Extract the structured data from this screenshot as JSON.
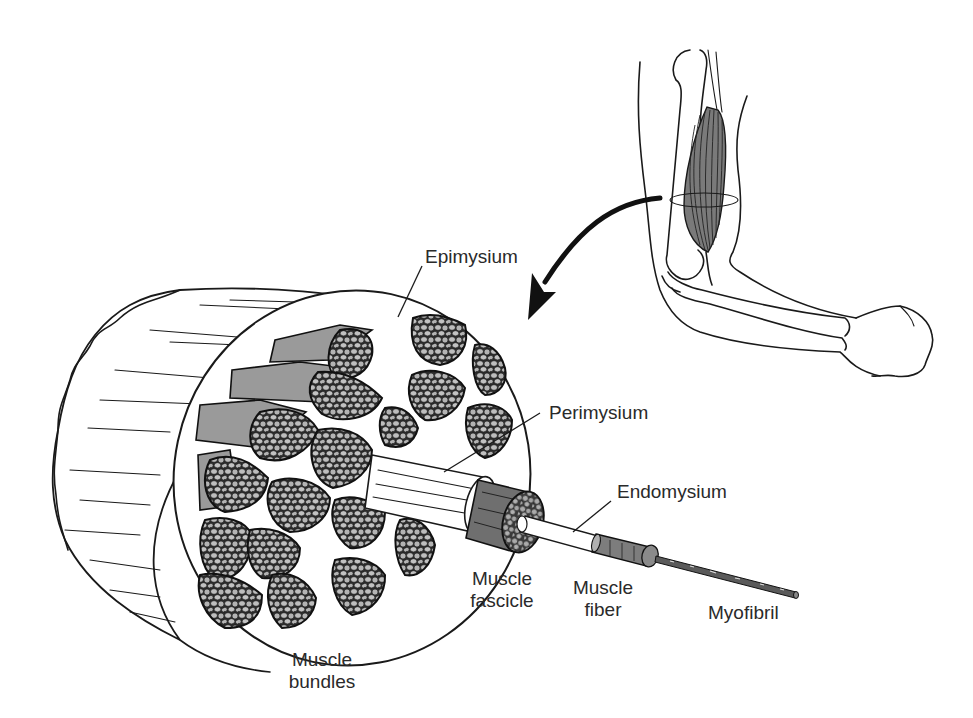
{
  "figure": {
    "type": "anatomical-diagram",
    "colors": {
      "background": "#ffffff",
      "ink": "#1a1a1a",
      "shading": "#8f8f8f",
      "label_text": "#2a2a2a"
    }
  },
  "labels": {
    "epimysium": "Epimysium",
    "perimysium": "Perimysium",
    "endomysium": "Endomysium",
    "muscle_fascicle_line1": "Muscle",
    "muscle_fascicle_line2": "fascicle",
    "muscle_fiber_line1": "Muscle",
    "muscle_fiber_line2": "fiber",
    "myofibril": "Myofibril",
    "muscle_bundles_line1": "Muscle",
    "muscle_bundles_line2": "bundles"
  },
  "illustrations": {
    "arm": "flexed-arm-with-biceps-highlighted",
    "arrow": "curved-arrow-from-arm-to-cross-section",
    "cross_section": "muscle-cylinder-cross-section"
  }
}
